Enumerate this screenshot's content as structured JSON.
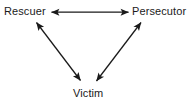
{
  "diagram": {
    "background_color": "#ffffff",
    "line_color": "#1a1a1a",
    "text_color": "#1a1a1a",
    "nodes": [
      {
        "id": "rescuer",
        "label": "Rescuer",
        "position": "top-left"
      },
      {
        "id": "persecutor",
        "label": "Persecutor",
        "position": "top-right"
      },
      {
        "id": "victim",
        "label": "Victim",
        "position": "bottom-center"
      }
    ],
    "edges": [
      {
        "id": "rescuer-persecutor",
        "from": "rescuer",
        "to": "persecutor",
        "arrowheads": "both",
        "orientation": "horizontal"
      },
      {
        "id": "rescuer-victim",
        "from": "rescuer",
        "to": "victim",
        "arrowheads": "both",
        "orientation": "diagonal-left"
      },
      {
        "id": "persecutor-victim",
        "from": "persecutor",
        "to": "victim",
        "arrowheads": "both",
        "orientation": "diagonal-right"
      }
    ]
  }
}
